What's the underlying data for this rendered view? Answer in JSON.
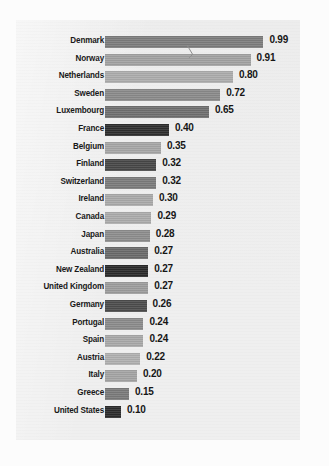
{
  "chart_data": {
    "type": "bar",
    "orientation": "horizontal",
    "title": "",
    "subtitle": "",
    "xlabel": "",
    "ylabel": "",
    "xlim": [
      0,
      1.0
    ],
    "grid": false,
    "legend": null,
    "value_format": "0.00",
    "categories": [
      "Denmark",
      "Norway",
      "Netherlands",
      "Sweden",
      "Luxembourg",
      "France",
      "Belgium",
      "Finland",
      "Switzerland",
      "Ireland",
      "Canada",
      "Japan",
      "Australia",
      "New Zealand",
      "United Kingdom",
      "Germany",
      "Portugal",
      "Spain",
      "Austria",
      "Italy",
      "Greece",
      "United States"
    ],
    "values": [
      0.99,
      0.91,
      0.8,
      0.72,
      0.65,
      0.4,
      0.35,
      0.32,
      0.32,
      0.3,
      0.29,
      0.28,
      0.27,
      0.27,
      0.27,
      0.26,
      0.24,
      0.24,
      0.22,
      0.2,
      0.15,
      0.1
    ],
    "value_labels": [
      "0.99",
      "0.91",
      "0.80",
      "0.72",
      "0.65",
      "0.40",
      "0.35",
      "0.32",
      "0.32",
      "0.30",
      "0.29",
      "0.28",
      "0.27",
      "0.27",
      "0.27",
      "0.26",
      "0.24",
      "0.24",
      "0.22",
      "0.20",
      "0.15",
      "0.10"
    ],
    "bar_colors": [
      "#7c7c7c",
      "#a2a2a2",
      "#acacac",
      "#8a8a8a",
      "#6f6f6f",
      "#2e2e2e",
      "#a6a6a6",
      "#474747",
      "#7b7b7b",
      "#a9a9a9",
      "#ababab",
      "#8d8d8d",
      "#6a6a6a",
      "#2b2b2b",
      "#9c9c9c",
      "#4c4c4c",
      "#8b8b8b",
      "#a8a8a8",
      "#b0b0b0",
      "#a4a4a4",
      "#7a7a7a",
      "#2c2c2c"
    ]
  },
  "style": {
    "panel_background": "#efefef",
    "page_background": "#fcfcfc",
    "label_color": "#191919",
    "value_color": "#161616"
  }
}
